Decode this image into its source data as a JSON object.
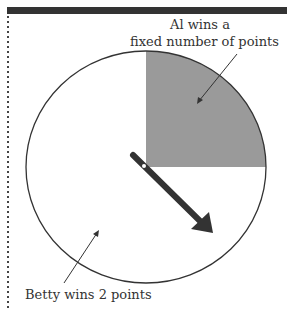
{
  "labels": {
    "al_line1": "Al wins a",
    "al_line2": "fixed number of points",
    "betty": "Betty wins 2 points"
  },
  "colors": {
    "topbar": "#333333",
    "quadrant_fill": "#999999",
    "outline": "#333333",
    "spinner": "#333333"
  }
}
